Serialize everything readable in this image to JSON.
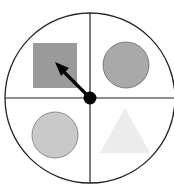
{
  "spinner": {
    "sections": [
      {
        "quadrant": "top-left",
        "shape": "square",
        "fill": "#9a9a9a"
      },
      {
        "quadrant": "top-right",
        "shape": "circle",
        "fill": "#a9a9a9"
      },
      {
        "quadrant": "bottom-left",
        "shape": "circle",
        "fill": "#c9c9c9"
      },
      {
        "quadrant": "bottom-right",
        "shape": "triangle",
        "fill": "#ececec"
      }
    ],
    "pointer_target": "top-left",
    "colors": {
      "outline": "#222222",
      "shape_stroke": "#707070",
      "arrow": "#000000",
      "background": "#ffffff"
    }
  }
}
